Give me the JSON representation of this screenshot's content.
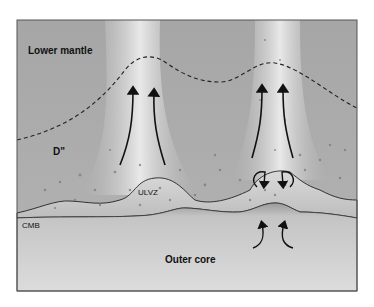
{
  "diagram": {
    "labels": {
      "lower_mantle": "Lower mantle",
      "d_double_prime": "D\"",
      "ulvz": "ULVZ",
      "cmb": "CMB",
      "outer_core": "Outer core"
    },
    "colors": {
      "mantle": "#a9a9a9",
      "plume": "#e6e6e6",
      "dlayer": "#b8b8b8",
      "core": "#d2d2d2",
      "frame": "#555555",
      "line": "#111111"
    }
  }
}
